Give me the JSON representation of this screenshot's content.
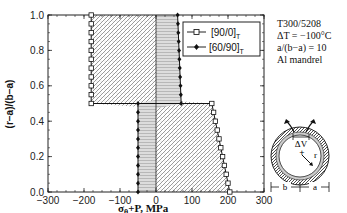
{
  "chart_data": {
    "type": "line",
    "title": "",
    "xlabel": "σθ+P, MPa",
    "ylabel": "(r−a)/(b−a)",
    "xlim": [
      -300,
      300
    ],
    "ylim": [
      0.0,
      1.0
    ],
    "xticks": [
      -300,
      -200,
      -100,
      0,
      100,
      200,
      300
    ],
    "yticks": [
      0.0,
      0.2,
      0.4,
      0.6,
      0.8,
      1.0
    ],
    "xtick_labels": [
      "−300",
      "−200",
      "−100",
      "0",
      "100",
      "200",
      "300"
    ],
    "ytick_labels": [
      "0.0",
      "0.2",
      "0.4",
      "0.6",
      "0.8",
      "1.0"
    ],
    "grid": false,
    "legend_position": "upper right",
    "series": [
      {
        "name": "[90/0]T",
        "marker": "open-square",
        "points": [
          [
            -180,
            1.0
          ],
          [
            -180,
            0.95
          ],
          [
            -180,
            0.9
          ],
          [
            -180,
            0.85
          ],
          [
            -180,
            0.8
          ],
          [
            -180,
            0.75
          ],
          [
            -180,
            0.7
          ],
          [
            -180,
            0.65
          ],
          [
            -180,
            0.6
          ],
          [
            -180,
            0.55
          ],
          [
            -180,
            0.5
          ],
          [
            155,
            0.5
          ],
          [
            160,
            0.45
          ],
          [
            165,
            0.4
          ],
          [
            170,
            0.35
          ],
          [
            175,
            0.3
          ],
          [
            180,
            0.25
          ],
          [
            185,
            0.2
          ],
          [
            190,
            0.15
          ],
          [
            195,
            0.1
          ],
          [
            200,
            0.05
          ],
          [
            205,
            0.0
          ]
        ]
      },
      {
        "name": "[60/90]T",
        "marker": "filled-diamond",
        "points": [
          [
            60,
            1.0
          ],
          [
            61,
            0.95
          ],
          [
            62,
            0.9
          ],
          [
            63,
            0.85
          ],
          [
            64,
            0.8
          ],
          [
            65,
            0.75
          ],
          [
            66,
            0.7
          ],
          [
            67,
            0.65
          ],
          [
            68,
            0.6
          ],
          [
            69,
            0.55
          ],
          [
            70,
            0.5
          ],
          [
            -50,
            0.5
          ],
          [
            -50,
            0.45
          ],
          [
            -50,
            0.4
          ],
          [
            -50,
            0.35
          ],
          [
            -50,
            0.3
          ],
          [
            -50,
            0.25
          ],
          [
            -50,
            0.2
          ],
          [
            -50,
            0.15
          ],
          [
            -50,
            0.1
          ],
          [
            -50,
            0.05
          ],
          [
            -50,
            0.0
          ]
        ]
      }
    ],
    "annotations": {
      "material": "T300/5208",
      "delta_t": "ΔT = −100°C",
      "ratio": "a/(b−a) = 10",
      "mandrel": "Al mandrel"
    }
  },
  "legend": {
    "items": [
      {
        "label": "[90/0]",
        "sub": "T"
      },
      {
        "label": "[60/90]",
        "sub": "T"
      }
    ]
  },
  "info": {
    "material": "T300/5208",
    "delta_t": "ΔT = −100°C",
    "ratio": "a/(b−a) = 10",
    "mandrel": "Al mandrel"
  },
  "diagram": {
    "delta_v": "ΔV",
    "r": "r",
    "b": "b",
    "a": "a"
  }
}
